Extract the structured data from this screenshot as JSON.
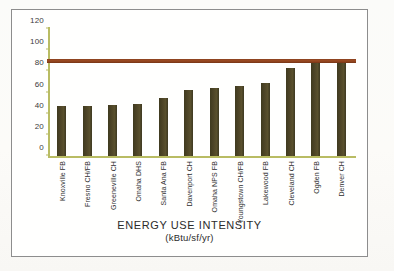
{
  "figure": {
    "frame_border_color": "#8d8d8d",
    "background_color": "#fffffe"
  },
  "chart_data": {
    "type": "bar",
    "title": "",
    "xlabel": "ENERGY USE INTENSITY",
    "xlabel_units": "(kBtu/sf/yr)",
    "ylabel": "",
    "ylim": [
      0,
      120
    ],
    "yticks": [
      0,
      20,
      40,
      60,
      80,
      100,
      120
    ],
    "ytick_labels": [
      "0",
      "20",
      "40",
      "60",
      "80",
      "100",
      "120"
    ],
    "grid": false,
    "legend": null,
    "categories": [
      "Knoxville FB",
      "Fresno CH/FB",
      "Greeneville CH",
      "Omaha DHS",
      "Santa Ana FB",
      "Davenport CH",
      "Omaha NPS FB",
      "Youngstown CH/FB",
      "Lakewood FB",
      "Cleveland CH",
      "Ogden FB",
      "Denver CH"
    ],
    "values": [
      47,
      47,
      48,
      49,
      55,
      62,
      64,
      66,
      69,
      83,
      88,
      88
    ],
    "bar_color": "#4e4527",
    "axis_color": "#b9bc63",
    "reference_line": {
      "label": "",
      "value": 88,
      "color": "#9c4b22"
    }
  }
}
